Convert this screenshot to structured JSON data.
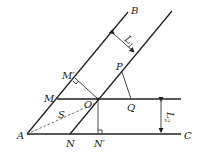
{
  "diagram": {
    "type": "geometry-figure",
    "points": {
      "A": {
        "label": "A",
        "x": 27,
        "y": 134
      },
      "B": {
        "label": "B",
        "x": 128,
        "y": 12
      },
      "C": {
        "label": "C",
        "x": 181,
        "y": 134
      },
      "M": {
        "label": "M",
        "x": 57,
        "y": 99
      },
      "M_prime": {
        "label": "M′",
        "x": 75,
        "y": 78
      },
      "O": {
        "label": "O",
        "x": 98,
        "y": 99
      },
      "P": {
        "label": "P",
        "x": 122,
        "y": 72
      },
      "Q": {
        "label": "Q",
        "x": 131,
        "y": 99
      },
      "N": {
        "label": "N",
        "x": 70,
        "y": 134
      },
      "N_prime": {
        "label": "N′",
        "x": 98,
        "y": 134
      }
    },
    "dimensions": {
      "L1": {
        "label": "L",
        "subscript": "1"
      },
      "L2": {
        "label": "L",
        "subscript": "2"
      },
      "S": {
        "label": "S"
      }
    }
  }
}
